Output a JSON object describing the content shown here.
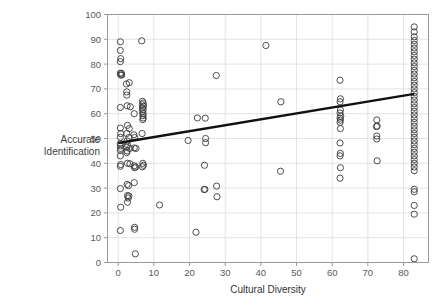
{
  "chart_data": {
    "type": "scatter",
    "title": "",
    "xlabel": "Cultural Diversity",
    "ylabel": "Accurate Identification",
    "ylabel_line1": "Accurate",
    "ylabel_line2": "Identification",
    "xlim": [
      -3,
      87
    ],
    "ylim": [
      0,
      100
    ],
    "xticks": [
      0,
      10,
      20,
      30,
      40,
      50,
      60,
      70,
      80
    ],
    "xtick_labels": [
      "0",
      "10",
      "20",
      "30",
      "40",
      "50",
      "60",
      "70",
      "80"
    ],
    "yticks": [
      0,
      10,
      20,
      30,
      40,
      50,
      60,
      70,
      80,
      90,
      100
    ],
    "ytick_labels": [
      "0",
      "10",
      "20",
      "30",
      "40",
      "50",
      "60",
      "70",
      "80",
      "90",
      "100"
    ],
    "grid": true,
    "grid_color": "#d9d9d9",
    "axis_color": "#9a9a9a",
    "marker": "open-circle",
    "marker_color": "#3a3a3a",
    "marker_radius": 3.1,
    "legend": "none",
    "trendline": {
      "type": "linear",
      "color": "#111111",
      "width": 2.4,
      "x_start": 0,
      "y_start": 48.2,
      "x_end": 83,
      "y_end": 68.0,
      "slope": 0.2386,
      "intercept": 48.2
    },
    "points": [
      [
        0.6,
        89.0
      ],
      [
        0.6,
        85.5
      ],
      [
        0.7,
        82.2
      ],
      [
        0.6,
        81.0
      ],
      [
        0.6,
        76.3
      ],
      [
        0.9,
        76.3
      ],
      [
        0.7,
        75.6
      ],
      [
        1.0,
        75.6
      ],
      [
        0.6,
        62.5
      ],
      [
        0.6,
        54.2
      ],
      [
        0.7,
        52.0
      ],
      [
        0.6,
        50.5
      ],
      [
        0.6,
        48.0
      ],
      [
        0.6,
        47.0
      ],
      [
        0.7,
        46.0
      ],
      [
        0.6,
        45.2
      ],
      [
        0.6,
        43.0
      ],
      [
        0.7,
        39.5
      ],
      [
        0.6,
        38.8
      ],
      [
        0.6,
        29.8
      ],
      [
        0.7,
        22.3
      ],
      [
        0.6,
        12.9
      ],
      [
        2.3,
        72.0
      ],
      [
        3.1,
        72.5
      ],
      [
        2.4,
        68.8
      ],
      [
        2.4,
        67.5
      ],
      [
        2.5,
        63.2
      ],
      [
        3.4,
        62.8
      ],
      [
        2.6,
        55.3
      ],
      [
        3.1,
        54.0
      ],
      [
        2.4,
        52.0
      ],
      [
        3.0,
        50.4
      ],
      [
        2.5,
        49.0
      ],
      [
        2.6,
        47.5
      ],
      [
        2.4,
        46.5
      ],
      [
        3.2,
        46.0
      ],
      [
        2.5,
        45.0
      ],
      [
        2.4,
        44.3
      ],
      [
        2.6,
        40.0
      ],
      [
        3.3,
        39.8
      ],
      [
        2.5,
        31.5
      ],
      [
        2.9,
        31.0
      ],
      [
        2.6,
        27.0
      ],
      [
        3.0,
        26.8
      ],
      [
        2.8,
        26.0
      ],
      [
        2.6,
        24.3
      ],
      [
        4.5,
        60.0
      ],
      [
        4.4,
        51.5
      ],
      [
        4.6,
        50.4
      ],
      [
        4.5,
        46.2
      ],
      [
        5.0,
        46.0
      ],
      [
        4.5,
        39.0
      ],
      [
        4.9,
        38.5
      ],
      [
        4.6,
        38.2
      ],
      [
        4.5,
        32.2
      ],
      [
        4.6,
        14.2
      ],
      [
        4.6,
        13.4
      ],
      [
        4.8,
        3.5
      ],
      [
        6.6,
        89.4
      ],
      [
        6.8,
        65.0
      ],
      [
        7.0,
        64.3
      ],
      [
        6.8,
        63.6
      ],
      [
        7.1,
        63.0
      ],
      [
        6.8,
        62.3
      ],
      [
        7.0,
        61.6
      ],
      [
        6.8,
        60.8
      ],
      [
        7.0,
        60.0
      ],
      [
        6.9,
        59.2
      ],
      [
        7.0,
        58.3
      ],
      [
        6.9,
        57.6
      ],
      [
        6.7,
        52.0
      ],
      [
        6.9,
        40.0
      ],
      [
        7.1,
        39.2
      ],
      [
        6.8,
        38.6
      ],
      [
        11.6,
        23.2
      ],
      [
        19.6,
        49.2
      ],
      [
        21.8,
        12.2
      ],
      [
        22.2,
        58.3
      ],
      [
        24.4,
        58.2
      ],
      [
        24.5,
        50.0
      ],
      [
        24.5,
        48.3
      ],
      [
        24.2,
        39.2
      ],
      [
        24.3,
        29.5
      ],
      [
        24.1,
        29.4
      ],
      [
        27.5,
        75.4
      ],
      [
        27.6,
        30.8
      ],
      [
        27.7,
        26.5
      ],
      [
        41.4,
        87.5
      ],
      [
        45.6,
        64.8
      ],
      [
        45.5,
        36.8
      ],
      [
        62.2,
        73.5
      ],
      [
        62.3,
        66.0
      ],
      [
        62.2,
        64.8
      ],
      [
        62.3,
        61.5
      ],
      [
        62.2,
        60.3
      ],
      [
        62.4,
        59.0
      ],
      [
        62.2,
        58.2
      ],
      [
        62.3,
        57.4
      ],
      [
        62.2,
        56.5
      ],
      [
        62.3,
        54.0
      ],
      [
        62.2,
        48.2
      ],
      [
        62.3,
        44.0
      ],
      [
        62.2,
        43.0
      ],
      [
        62.3,
        38.2
      ],
      [
        62.2,
        34.0
      ],
      [
        72.5,
        57.5
      ],
      [
        72.6,
        55.0
      ],
      [
        72.4,
        54.8
      ],
      [
        72.5,
        51.0
      ],
      [
        72.5,
        49.8
      ],
      [
        72.6,
        41.0
      ],
      [
        83.0,
        95.0
      ],
      [
        83.0,
        93.0
      ],
      [
        83.0,
        91.0
      ],
      [
        83.0,
        89.5
      ],
      [
        83.0,
        88.0
      ],
      [
        83.0,
        86.5
      ],
      [
        83.0,
        85.0
      ],
      [
        83.0,
        83.5
      ],
      [
        83.0,
        82.0
      ],
      [
        83.0,
        80.5
      ],
      [
        83.0,
        79.0
      ],
      [
        83.0,
        77.5
      ],
      [
        83.0,
        76.0
      ],
      [
        83.0,
        74.5
      ],
      [
        83.0,
        73.0
      ],
      [
        83.0,
        71.5
      ],
      [
        83.0,
        70.0
      ],
      [
        83.0,
        68.5
      ],
      [
        83.0,
        67.0
      ],
      [
        83.0,
        65.5
      ],
      [
        83.0,
        64.0
      ],
      [
        83.0,
        62.5
      ],
      [
        83.0,
        61.0
      ],
      [
        83.0,
        59.5
      ],
      [
        83.0,
        58.0
      ],
      [
        83.0,
        56.5
      ],
      [
        83.0,
        55.0
      ],
      [
        83.0,
        53.5
      ],
      [
        83.0,
        52.0
      ],
      [
        83.0,
        50.5
      ],
      [
        83.0,
        49.0
      ],
      [
        83.0,
        47.5
      ],
      [
        83.0,
        46.0
      ],
      [
        83.0,
        44.5
      ],
      [
        83.0,
        43.0
      ],
      [
        83.0,
        41.5
      ],
      [
        83.0,
        40.0
      ],
      [
        83.0,
        38.5
      ],
      [
        83.0,
        37.0
      ],
      [
        83.0,
        29.5
      ],
      [
        83.0,
        28.5
      ],
      [
        83.0,
        23.0
      ],
      [
        83.0,
        19.5
      ],
      [
        83.0,
        1.5
      ]
    ]
  }
}
